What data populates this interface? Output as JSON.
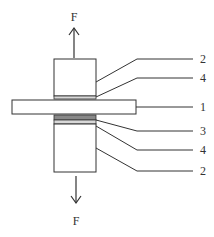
{
  "diagram": {
    "force_top": "F",
    "force_bottom": "F",
    "labels": [
      "2",
      "4",
      "1",
      "3",
      "4",
      "2"
    ],
    "colors": {
      "stroke": "#333333",
      "plate_fill": "#ffffff",
      "layer3_fill": "#888888",
      "layer4_fill": "#d8d8d8"
    }
  }
}
